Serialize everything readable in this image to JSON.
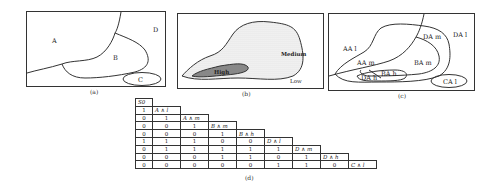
{
  "panels": {
    "a": {
      "caption": "(a)",
      "regions": [
        "A",
        "B",
        "C",
        "D"
      ]
    },
    "b": {
      "caption": "(b)",
      "regions": [
        "High",
        "Medium",
        "Low"
      ]
    },
    "c": {
      "caption": "(c)",
      "regions": [
        "AA l",
        "AA m",
        "BA m",
        "BA h",
        "DA h",
        "DA m",
        "DA l",
        "CA l"
      ]
    },
    "d": {
      "caption": "(d)",
      "corner_label": "S0",
      "column_headers": [
        "A ∧ l",
        "A ∧ m",
        "B ∧ m",
        "B ∧ h",
        "D ∧ l",
        "D ∧ m",
        "D ∧ h",
        "C ∧ l"
      ],
      "rows": [
        [
          "1"
        ],
        [
          "0",
          "1"
        ],
        [
          "0",
          "0",
          "1"
        ],
        [
          "0",
          "0",
          "0",
          "1"
        ],
        [
          "1",
          "1",
          "1",
          "0",
          "0"
        ],
        [
          "0",
          "1",
          "1",
          "1",
          "1",
          "1"
        ],
        [
          "0",
          "0",
          "0",
          "1",
          "1",
          "0",
          "1"
        ],
        [
          "0",
          "0",
          "0",
          "0",
          "0",
          "1",
          "1",
          "0"
        ]
      ]
    }
  }
}
